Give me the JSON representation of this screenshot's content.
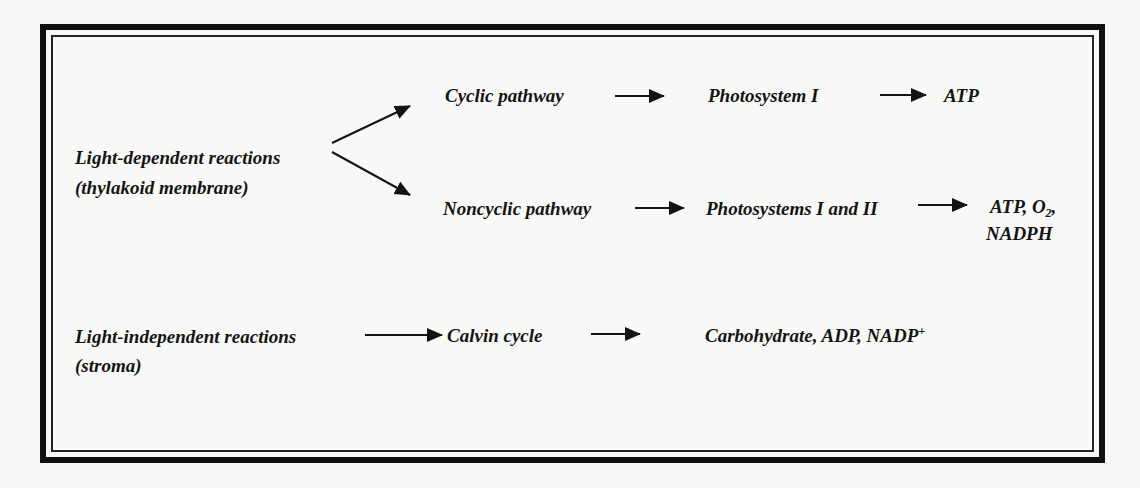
{
  "diagram": {
    "type": "flow-diagram",
    "topic": "Photosynthesis reactions",
    "nodes": {
      "light_dependent": {
        "title": "Light-dependent reactions",
        "location": "(thylakoid membrane)"
      },
      "cyclic": {
        "label": "Cyclic pathway"
      },
      "ps1": {
        "label": "Photosystem I"
      },
      "cyclic_product": {
        "label": "ATP"
      },
      "noncyclic": {
        "label": "Noncyclic pathway"
      },
      "ps12": {
        "label": "Photosystems I and II"
      },
      "noncyclic_product": {
        "line1_prefix": "ATP, O",
        "line1_sub": "2",
        "line1_suffix": ",",
        "line2": "NADPH"
      },
      "light_independent": {
        "title": "Light-independent reactions",
        "location": "(stroma)"
      },
      "calvin": {
        "label": "Calvin cycle"
      },
      "calvin_product": {
        "prefix": "Carbohydrate, ADP, NADP",
        "sup": "+"
      }
    },
    "edges": [
      {
        "from": "Light-dependent reactions",
        "to": "Cyclic pathway"
      },
      {
        "from": "Light-dependent reactions",
        "to": "Noncyclic pathway"
      },
      {
        "from": "Cyclic pathway",
        "to": "Photosystem I"
      },
      {
        "from": "Photosystem I",
        "to": "ATP"
      },
      {
        "from": "Noncyclic pathway",
        "to": "Photosystems I and II"
      },
      {
        "from": "Photosystems I and II",
        "to": "ATP, O2, NADPH"
      },
      {
        "from": "Light-independent reactions",
        "to": "Calvin cycle"
      },
      {
        "from": "Calvin cycle",
        "to": "Carbohydrate, ADP, NADP+"
      }
    ],
    "colors": {
      "ink": "#141414",
      "background": "#f7f7f5",
      "frame": "#111111"
    }
  }
}
